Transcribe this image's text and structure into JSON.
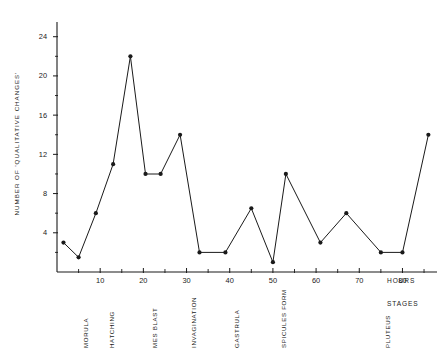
{
  "chart_data": {
    "type": "line",
    "title": "",
    "xlabel": "HOURS",
    "ylabel": "NUMBER  OF  'QUALITATIVE  CHANGES'",
    "x_axis_secondary_label": "STAGES",
    "xlim": [
      0,
      88
    ],
    "ylim": [
      0,
      25.5
    ],
    "grid": false,
    "legend": null,
    "x_major_ticks": [
      10,
      20,
      30,
      40,
      50,
      60,
      70,
      80
    ],
    "x_major_tick_labels": [
      "10",
      "20",
      "30",
      "40",
      "50",
      "60",
      "70",
      "80"
    ],
    "x_minor_tick_interval": 5,
    "y_major_ticks": [
      4,
      8,
      12,
      16,
      20,
      24
    ],
    "y_major_tick_labels": [
      "4",
      "8",
      "12",
      "16",
      "20",
      "24"
    ],
    "y_minor_tick_interval": 2,
    "marker": "filled-circle",
    "line_color": "#1a1a1a",
    "x": [
      1.5,
      5,
      9,
      13,
      17,
      20.5,
      24,
      28.5,
      33,
      39,
      45,
      50,
      53,
      61,
      67,
      75,
      80,
      86
    ],
    "y": [
      3,
      1.5,
      6,
      11,
      22,
      10,
      10,
      14,
      2,
      2,
      6.5,
      1,
      10,
      3,
      6,
      2,
      2,
      14
    ],
    "values": [
      3,
      1.5,
      6,
      11,
      22,
      10,
      10,
      14,
      2,
      2,
      6.5,
      1,
      10,
      3,
      6,
      2,
      2,
      14
    ],
    "stage_annotations": [
      {
        "label": "MORULA",
        "hours": 5
      },
      {
        "label": "HATCHING",
        "hours": 11
      },
      {
        "label": "MES  BLAST",
        "hours": 21
      },
      {
        "label": "INVAGINATION",
        "hours": 30
      },
      {
        "label": "GASTRULA",
        "hours": 40
      },
      {
        "label": "SPICULES  FORM",
        "hours": 51
      },
      {
        "label": "PLUTEUS",
        "hours": 75
      }
    ]
  },
  "axis": {
    "y_title": "NUMBER  OF  'QUALITATIVE  CHANGES'",
    "x_unit_label": "HOURS",
    "x_category_label": "STAGES"
  }
}
